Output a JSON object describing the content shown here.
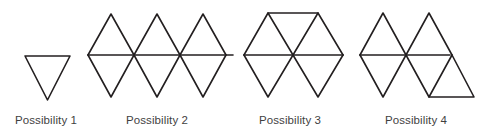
{
  "figure": {
    "title": "Possibility 1 Possibility 2 Possibility 3 Possibility 4",
    "width": 494,
    "height": 135,
    "background_color": "#ffffff",
    "stroke_color": "#231f20",
    "stroke_width": 1.6,
    "label_color": "#3f3f3f"
  },
  "chart_data": {
    "type": "diagram",
    "title": "",
    "xlabel": "",
    "ylabel": "",
    "items": [
      {
        "label": "Possibility 1",
        "triangle_count": 1,
        "shape": "single downward-pointing triangle",
        "polylines": [
          "25,56 70,56 47.5,100 25,56"
        ]
      },
      {
        "label": "Possibility 2",
        "triangle_count": 6,
        "shape": "horizontal strip of alternating up and down triangles",
        "polylines": [
          "88,55 233,55",
          "88,55 111,14 134,55 157,14 180,55 203,14 226,55",
          "88,55 111,97 134,55 157,97 180,55 203,97 226,55"
        ]
      },
      {
        "label": "Possibility 3",
        "triangle_count": 6,
        "shape": "hexagonal arrangement of six triangles about a center point",
        "polylines": [
          "244,55 343,55",
          "268,13 318,13",
          "244,55 268,13 293,55 318,13 343,55",
          "244,55 268,97 293,55 318,97 343,55"
        ]
      },
      {
        "label": "Possibility 4",
        "triangle_count": 6,
        "shape": "strip of five triangles with a sixth triangle attached below on the right",
        "polylines": [
          "360,55 450,55",
          "360,55 383,13 406,55 429,13 452,55",
          "360,55 383,97 406,55 429,97 452,55",
          "429,97 474,97 452,55"
        ]
      }
    ]
  },
  "labels": [
    {
      "text": "Possibility 1"
    },
    {
      "text": "Possibility 2"
    },
    {
      "text": "Possibility 3"
    },
    {
      "text": "Possibility 4"
    }
  ]
}
